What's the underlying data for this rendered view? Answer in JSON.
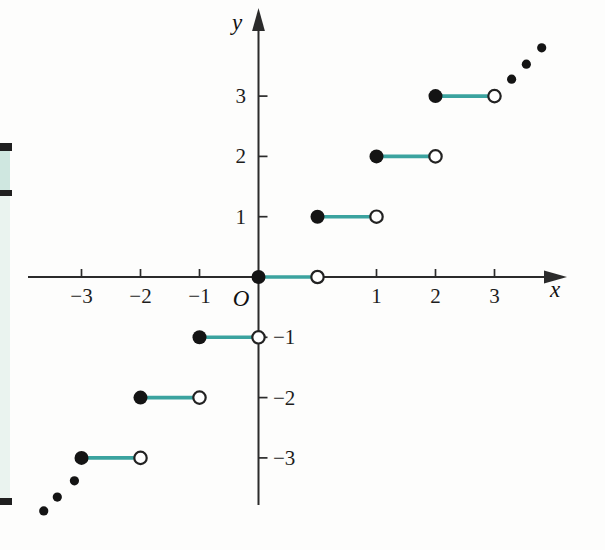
{
  "figure": {
    "background": "#fdfdfc",
    "colors": {
      "segment_teal": "#3ba39f",
      "axis": "#2b2b2b",
      "dot_black": "#141414",
      "open_circle_ring": "#222222",
      "open_circle_fill": "#ffffff",
      "strip_bar_black": "#1f1f1f",
      "strip_teal": "#cfe7e0",
      "strip_pale_mint": "#eaf3ef"
    }
  },
  "chart_data": {
    "type": "line",
    "subtype": "step",
    "function": "y = ⌊x⌋ (greatest integer / floor step function)",
    "title": "",
    "xlabel": "x",
    "ylabel": "y",
    "origin_label": "O",
    "grid": false,
    "legend": "none",
    "xlim": [
      -3.9,
      5.2
    ],
    "ylim": [
      -4.4,
      4.4
    ],
    "segments": [
      {
        "y": -3,
        "x_closed": -3,
        "x_open": -2
      },
      {
        "y": -2,
        "x_closed": -2,
        "x_open": -1
      },
      {
        "y": -1,
        "x_closed": -1,
        "x_open": 0
      },
      {
        "y": 0,
        "x_closed": 0,
        "x_open": 1
      },
      {
        "y": 1,
        "x_closed": 1,
        "x_open": 2
      },
      {
        "y": 2,
        "x_closed": 2,
        "x_open": 3
      },
      {
        "y": 3,
        "x_closed": 3,
        "x_open": 4
      }
    ],
    "endpoint_style": {
      "closed": "filled black dot",
      "open": "white circle with dark ring"
    },
    "continuation_dots": {
      "upper_right": [
        [
          4.29,
          3.28
        ],
        [
          4.54,
          3.53
        ],
        [
          4.8,
          3.8
        ]
      ],
      "lower_left": [
        [
          -3.64,
          -3.88
        ],
        [
          -3.41,
          -3.65
        ],
        [
          -3.12,
          -3.38
        ]
      ]
    },
    "x_ticks": [
      {
        "label": "−3",
        "u": -3
      },
      {
        "label": "−2",
        "u": -2
      },
      {
        "label": "−1",
        "u": -1
      },
      {
        "label": "1",
        "u": 2
      },
      {
        "label": "2",
        "u": 3
      },
      {
        "label": "3",
        "u": 4
      }
    ],
    "x_ticks_note": "tick positions u are units from origin as printed in the source image",
    "y_ticks": [
      {
        "label": "3",
        "v": 3,
        "side": "left"
      },
      {
        "label": "2",
        "v": 2,
        "side": "left"
      },
      {
        "label": "1",
        "v": 1,
        "side": "left"
      },
      {
        "label": "−1",
        "v": -1,
        "side": "right"
      },
      {
        "label": "−2",
        "v": -2,
        "side": "right"
      },
      {
        "label": "−3",
        "v": -3,
        "side": "right"
      }
    ]
  }
}
